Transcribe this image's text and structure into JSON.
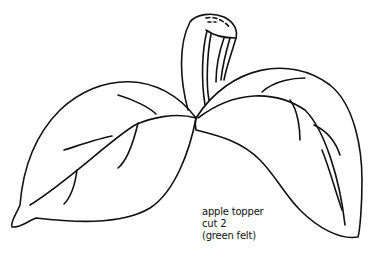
{
  "pattern": {
    "caption": {
      "line1": "apple topper",
      "line2": "cut 2",
      "line3": "(green felt)"
    },
    "parts": [
      "left-leaf",
      "right-leaf",
      "stem"
    ],
    "colors": {
      "line": "#111111",
      "background": "#ffffff"
    }
  }
}
